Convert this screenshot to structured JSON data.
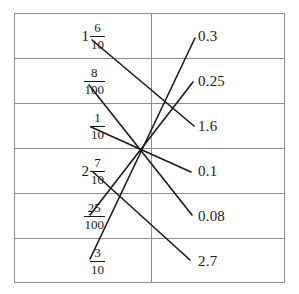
{
  "worksheet": {
    "title": "Fraction to decimal matching exercise",
    "rows": 6,
    "border_color": "#8e8e8e",
    "line_color": "#1a1a1a",
    "background": "#ffffff"
  },
  "left_column": [
    {
      "whole": "1",
      "numerator": "6",
      "denominator": "10",
      "display": "1 6/10"
    },
    {
      "whole": "",
      "numerator": "8",
      "denominator": "100",
      "display": "8/100"
    },
    {
      "whole": "",
      "numerator": "1",
      "denominator": "10",
      "display": "1/10"
    },
    {
      "whole": "2",
      "numerator": "7",
      "denominator": "10",
      "display": "2 7/10"
    },
    {
      "whole": "",
      "numerator": "25",
      "denominator": "100",
      "display": "25/100"
    },
    {
      "whole": "",
      "numerator": "3",
      "denominator": "10",
      "display": "3/10"
    }
  ],
  "right_column": [
    {
      "value": "0.3"
    },
    {
      "value": "0.25"
    },
    {
      "value": "1.6"
    },
    {
      "value": "0.1"
    },
    {
      "value": "0.08"
    },
    {
      "value": "2.7"
    }
  ],
  "connector_lines": [
    {
      "from": "1 6/10",
      "to": "1.6",
      "x1": 92,
      "y1": 40,
      "x2": 194,
      "y2": 126
    },
    {
      "from": "8/100",
      "to": "0.08",
      "x1": 89,
      "y1": 85,
      "x2": 192,
      "y2": 215
    },
    {
      "from": "1/10",
      "to": "0.1",
      "x1": 91,
      "y1": 127,
      "x2": 191,
      "y2": 172
    },
    {
      "from": "2 7/10",
      "to": "2.7",
      "x1": 93,
      "y1": 172,
      "x2": 190,
      "y2": 260
    },
    {
      "from": "25/100",
      "to": "0.25",
      "x1": 90,
      "y1": 215,
      "x2": 193,
      "y2": 82
    },
    {
      "from": "3/10",
      "to": "0.3",
      "x1": 90,
      "y1": 259,
      "x2": 195,
      "y2": 38
    }
  ]
}
